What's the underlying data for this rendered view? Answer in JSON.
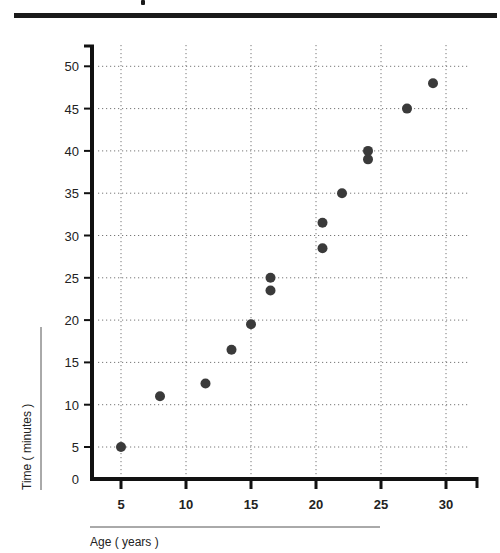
{
  "chart_data": {
    "type": "scatter",
    "title": "",
    "xlabel": "Age ( years )",
    "ylabel": "Time ( minutes )",
    "x_ticks": [
      5,
      10,
      15,
      20,
      25,
      30
    ],
    "y_ticks": [
      0,
      5,
      10,
      15,
      20,
      25,
      30,
      35,
      40,
      45,
      50
    ],
    "xlim": [
      2.5,
      32.5
    ],
    "ylim": [
      0,
      52
    ],
    "grid": true,
    "grid_style": "dotted",
    "marker_color": "#3a3a3a",
    "points": [
      {
        "x": 5,
        "y": 5
      },
      {
        "x": 8,
        "y": 11
      },
      {
        "x": 11.5,
        "y": 12.5
      },
      {
        "x": 13.5,
        "y": 16.5
      },
      {
        "x": 15,
        "y": 19.5
      },
      {
        "x": 16.5,
        "y": 25
      },
      {
        "x": 16.5,
        "y": 23.5
      },
      {
        "x": 20.5,
        "y": 28.5
      },
      {
        "x": 20.5,
        "y": 31.5
      },
      {
        "x": 22,
        "y": 35
      },
      {
        "x": 24,
        "y": 40
      },
      {
        "x": 24,
        "y": 39
      },
      {
        "x": 27,
        "y": 45
      },
      {
        "x": 29,
        "y": 48
      }
    ]
  },
  "labels": {
    "xlabel": "Age ( years )",
    "ylabel": "Time ( minutes )"
  }
}
